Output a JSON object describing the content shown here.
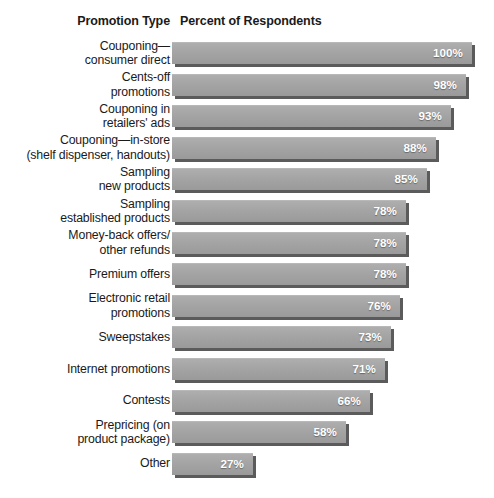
{
  "header": {
    "category_header": "Promotion Type",
    "value_header": "Percent of Respondents"
  },
  "chart_data": {
    "type": "bar",
    "orientation": "horizontal",
    "title": "",
    "subtitle": "",
    "xlabel": "Percent of Respondents",
    "ylabel": "Promotion Type",
    "xlim": [
      0,
      100
    ],
    "grid": false,
    "legend": null,
    "value_suffix": "%",
    "bar_color": "#a4a4a4",
    "value_label_color": "#ffffff",
    "text_color": "#1a1a1a",
    "background_color": "#ffffff",
    "categories": [
      "Couponing—consumer direct",
      "Cents-off promotions",
      "Couponing in retailers' ads",
      "Couponing—in-store (shelf dispenser, handouts)",
      "Sampling new products",
      "Sampling established products",
      "Money-back offers/other refunds",
      "Premium offers",
      "Electronic retail promotions",
      "Sweepstakes",
      "Internet promotions",
      "Contests",
      "Prepricing (on product package)",
      "Other"
    ],
    "category_lines": [
      [
        "Couponing—",
        "consumer direct"
      ],
      [
        "Cents-off",
        "promotions"
      ],
      [
        "Couponing in",
        "retailers' ads"
      ],
      [
        "Couponing—in-store",
        "(shelf dispenser, handouts)"
      ],
      [
        "Sampling",
        "new products"
      ],
      [
        "Sampling",
        "established products"
      ],
      [
        "Money-back offers/",
        "other refunds"
      ],
      [
        "Premium offers"
      ],
      [
        "Electronic retail",
        "promotions"
      ],
      [
        "Sweepstakes"
      ],
      [
        "Internet promotions"
      ],
      [
        "Contests"
      ],
      [
        "Prepricing (on",
        "product package)"
      ],
      [
        "Other"
      ]
    ],
    "values": [
      100,
      98,
      93,
      88,
      85,
      78,
      78,
      78,
      76,
      73,
      71,
      66,
      58,
      27
    ],
    "value_labels": [
      "100%",
      "98%",
      "93%",
      "88%",
      "85%",
      "78%",
      "78%",
      "78%",
      "76%",
      "73%",
      "71%",
      "66%",
      "58%",
      "27%"
    ]
  }
}
